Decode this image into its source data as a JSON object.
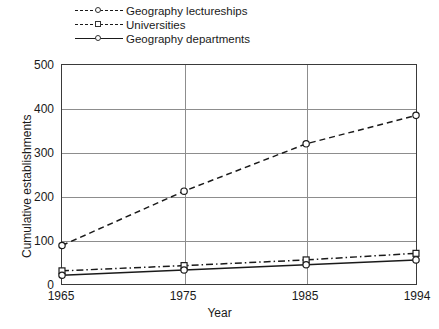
{
  "chart_data": {
    "type": "line",
    "title": "",
    "xlabel": "Year",
    "ylabel": "Cumulative establishments",
    "x": [
      1965,
      1975,
      1985,
      1994
    ],
    "xtick_labels": [
      "1965",
      "1975",
      "1985",
      "1994"
    ],
    "ytick_labels": [
      "0",
      "100",
      "200",
      "300",
      "400",
      "500"
    ],
    "yticks": [
      0,
      100,
      200,
      300,
      400,
      500
    ],
    "ylim": [
      0,
      500
    ],
    "xlim": [
      1965,
      1994
    ],
    "grid": "horizontal-and-vertical",
    "legend_position": "above-plot-left",
    "series": [
      {
        "name": "Geography lectureships",
        "values": [
          88,
          212,
          320,
          385
        ],
        "line_style": "dashed",
        "marker": "circle",
        "color": "#1a1a1a"
      },
      {
        "name": "Universities",
        "values": [
          30,
          42,
          55,
          70
        ],
        "line_style": "dash-dot",
        "marker": "square",
        "color": "#1a1a1a"
      },
      {
        "name": "Geography departments",
        "values": [
          20,
          32,
          44,
          55
        ],
        "line_style": "solid",
        "marker": "circle",
        "color": "#1a1a1a"
      }
    ]
  },
  "legend": {
    "items": [
      {
        "label": "Geography lectureships",
        "key_style": "dashed",
        "marker": "circle"
      },
      {
        "label": "Universities",
        "key_style": "dash-dot",
        "marker": "square"
      },
      {
        "label": "Geography departments",
        "key_style": "solid",
        "marker": "circle"
      }
    ]
  },
  "axes": {
    "y_title": "Cumulative establishments",
    "x_title": "Year",
    "y_ticks": [
      "500",
      "400",
      "300",
      "200",
      "100",
      "0"
    ],
    "x_ticks": [
      "1965",
      "1975",
      "1985",
      "1994"
    ]
  },
  "colors": {
    "ink": "#1a1a1a",
    "grid": "#8d8d8d",
    "frame": "#3a3a3a",
    "background": "#ffffff"
  }
}
